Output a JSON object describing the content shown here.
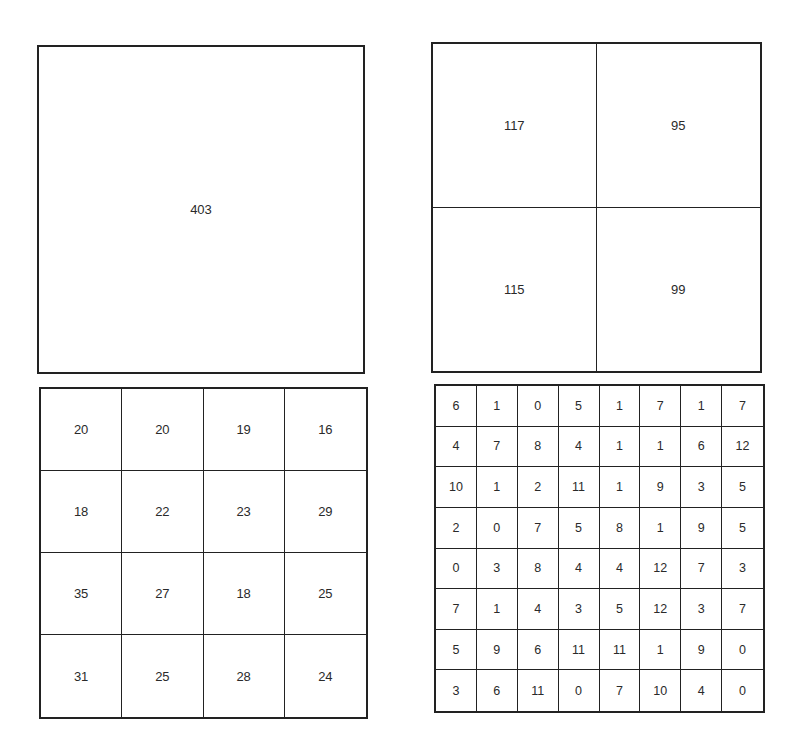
{
  "grids": {
    "grid_1x1": {
      "rows": 1,
      "cols": 1,
      "values": [
        [
          403
        ]
      ]
    },
    "grid_2x2": {
      "rows": 2,
      "cols": 2,
      "values": [
        [
          117,
          95
        ],
        [
          115,
          99
        ]
      ]
    },
    "grid_4x4": {
      "rows": 4,
      "cols": 4,
      "values": [
        [
          20,
          20,
          19,
          16
        ],
        [
          18,
          22,
          23,
          29
        ],
        [
          35,
          27,
          18,
          25
        ],
        [
          31,
          25,
          28,
          24
        ]
      ]
    },
    "grid_8x8": {
      "rows": 8,
      "cols": 8,
      "values": [
        [
          6,
          1,
          0,
          5,
          1,
          7,
          1,
          7
        ],
        [
          4,
          7,
          8,
          4,
          1,
          1,
          6,
          12
        ],
        [
          10,
          1,
          2,
          11,
          1,
          9,
          3,
          5
        ],
        [
          2,
          0,
          7,
          5,
          8,
          1,
          9,
          5
        ],
        [
          0,
          3,
          8,
          4,
          4,
          12,
          7,
          3
        ],
        [
          7,
          1,
          4,
          3,
          5,
          12,
          3,
          7
        ],
        [
          5,
          9,
          6,
          11,
          11,
          1,
          9,
          0
        ],
        [
          3,
          6,
          11,
          0,
          7,
          10,
          4,
          0
        ]
      ]
    }
  },
  "colors": {
    "line": "#222222",
    "text": "#2a2a2a",
    "background": "#ffffff"
  }
}
